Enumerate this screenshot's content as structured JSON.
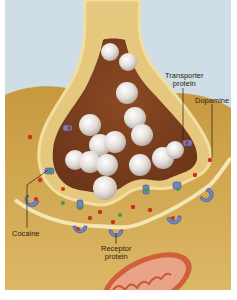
{
  "figure": {
    "type": "synapse-illustration",
    "colors": {
      "background": "#cfdde6",
      "cytoplasm": "#c9a047",
      "membrane": "#f2dfa0",
      "terminal_interior": "#7a3d1f",
      "vesicle": "#e6e2df",
      "dopamine": "#c8321e",
      "cocaine": "#3a9a5a",
      "protein": "#6f86c4",
      "mitochondrion": "#d0603a"
    },
    "labels": {
      "transporter_line1": "Transporter",
      "transporter_line2": "protein",
      "dopamine": "Dopamine",
      "cocaine": "Cocaine",
      "receptor_line1": "Receptor",
      "receptor_line2": "protein"
    }
  }
}
